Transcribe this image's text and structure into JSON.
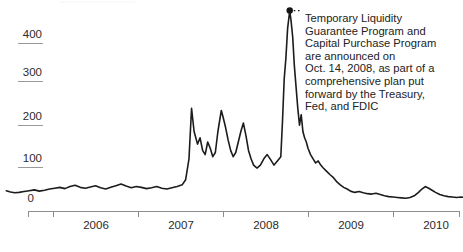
{
  "chart_data": {
    "type": "line",
    "title": "",
    "xlabel": "",
    "ylabel": "",
    "xlim": [
      2005.4,
      2010.85
    ],
    "ylim": [
      0,
      470
    ],
    "grid": false,
    "legend": null,
    "y_ticks": [
      0,
      100,
      200,
      300,
      400
    ],
    "y_tick_labels": [
      "0",
      "100",
      "200",
      "300",
      "400"
    ],
    "x_ticks": [
      2005.4,
      2006.0,
      2007.0,
      2008.0,
      2009.0,
      2010.0,
      2010.85
    ],
    "x_tick_labels": [
      "2006",
      "2007",
      "2008",
      "2009",
      "2010"
    ],
    "series": [
      {
        "name": "TED spread (basis points)",
        "color": "#1c1c1c",
        "points": [
          [
            2005.45,
            34
          ],
          [
            2005.5,
            31
          ],
          [
            2005.55,
            29
          ],
          [
            2005.6,
            30
          ],
          [
            2005.66,
            32
          ],
          [
            2005.72,
            34
          ],
          [
            2005.78,
            36
          ],
          [
            2005.84,
            33
          ],
          [
            2005.9,
            35
          ],
          [
            2005.96,
            38
          ],
          [
            2006.02,
            40
          ],
          [
            2006.08,
            42
          ],
          [
            2006.14,
            39
          ],
          [
            2006.2,
            44
          ],
          [
            2006.26,
            47
          ],
          [
            2006.32,
            42
          ],
          [
            2006.38,
            40
          ],
          [
            2006.44,
            43
          ],
          [
            2006.5,
            46
          ],
          [
            2006.56,
            41
          ],
          [
            2006.62,
            38
          ],
          [
            2006.68,
            42
          ],
          [
            2006.74,
            46
          ],
          [
            2006.8,
            50
          ],
          [
            2006.86,
            45
          ],
          [
            2006.92,
            41
          ],
          [
            2006.98,
            44
          ],
          [
            2007.04,
            42
          ],
          [
            2007.1,
            39
          ],
          [
            2007.16,
            41
          ],
          [
            2007.22,
            44
          ],
          [
            2007.28,
            40
          ],
          [
            2007.34,
            38
          ],
          [
            2007.4,
            41
          ],
          [
            2007.46,
            44
          ],
          [
            2007.52,
            48
          ],
          [
            2007.56,
            60
          ],
          [
            2007.6,
            110
          ],
          [
            2007.63,
            230
          ],
          [
            2007.66,
            175
          ],
          [
            2007.7,
            145
          ],
          [
            2007.73,
            160
          ],
          [
            2007.76,
            130
          ],
          [
            2007.79,
            120
          ],
          [
            2007.82,
            150
          ],
          [
            2007.85,
            135
          ],
          [
            2007.88,
            115
          ],
          [
            2007.91,
            125
          ],
          [
            2007.94,
            175
          ],
          [
            2007.96,
            200
          ],
          [
            2007.98,
            225
          ],
          [
            2008.0,
            210
          ],
          [
            2008.03,
            185
          ],
          [
            2008.06,
            155
          ],
          [
            2008.09,
            130
          ],
          [
            2008.12,
            115
          ],
          [
            2008.15,
            125
          ],
          [
            2008.18,
            150
          ],
          [
            2008.21,
            175
          ],
          [
            2008.24,
            195
          ],
          [
            2008.27,
            165
          ],
          [
            2008.3,
            130
          ],
          [
            2008.33,
            110
          ],
          [
            2008.36,
            95
          ],
          [
            2008.4,
            88
          ],
          [
            2008.44,
            95
          ],
          [
            2008.48,
            110
          ],
          [
            2008.52,
            120
          ],
          [
            2008.56,
            108
          ],
          [
            2008.6,
            95
          ],
          [
            2008.64,
            105
          ],
          [
            2008.68,
            115
          ],
          [
            2008.7,
            200
          ],
          [
            2008.72,
            300
          ],
          [
            2008.74,
            350
          ],
          [
            2008.76,
            420
          ],
          [
            2008.785,
            463
          ],
          [
            2008.8,
            440
          ],
          [
            2008.82,
            400
          ],
          [
            2008.84,
            330
          ],
          [
            2008.86,
            280
          ],
          [
            2008.88,
            230
          ],
          [
            2008.9,
            190
          ],
          [
            2008.92,
            215
          ],
          [
            2008.94,
            175
          ],
          [
            2008.96,
            160
          ],
          [
            2008.98,
            150
          ],
          [
            2009.0,
            135
          ],
          [
            2009.03,
            120
          ],
          [
            2009.06,
            110
          ],
          [
            2009.09,
            100
          ],
          [
            2009.12,
            105
          ],
          [
            2009.15,
            95
          ],
          [
            2009.18,
            88
          ],
          [
            2009.22,
            80
          ],
          [
            2009.26,
            72
          ],
          [
            2009.3,
            65
          ],
          [
            2009.34,
            55
          ],
          [
            2009.38,
            48
          ],
          [
            2009.42,
            42
          ],
          [
            2009.46,
            38
          ],
          [
            2009.5,
            33
          ],
          [
            2009.55,
            30
          ],
          [
            2009.6,
            32
          ],
          [
            2009.65,
            29
          ],
          [
            2009.7,
            27
          ],
          [
            2009.75,
            26
          ],
          [
            2009.8,
            28
          ],
          [
            2009.85,
            25
          ],
          [
            2009.9,
            22
          ],
          [
            2009.95,
            20
          ],
          [
            2010.0,
            19
          ],
          [
            2010.05,
            18
          ],
          [
            2010.1,
            17
          ],
          [
            2010.15,
            16
          ],
          [
            2010.2,
            18
          ],
          [
            2010.25,
            22
          ],
          [
            2010.3,
            30
          ],
          [
            2010.34,
            38
          ],
          [
            2010.38,
            44
          ],
          [
            2010.42,
            40
          ],
          [
            2010.46,
            35
          ],
          [
            2010.5,
            30
          ],
          [
            2010.55,
            25
          ],
          [
            2010.6,
            22
          ],
          [
            2010.65,
            20
          ],
          [
            2010.7,
            19
          ],
          [
            2010.75,
            18
          ],
          [
            2010.8,
            19
          ],
          [
            2010.84,
            18
          ]
        ]
      }
    ],
    "annotations": [
      {
        "name": "tlgp-cpp-announcement",
        "text": "Temporary Liquidity\nGuarantee Program and\nCapital Purchase Program\nare announced on\nOct. 14, 2008, as part of a\ncomprehensive plan put\nforward by the Treasury,\nFed, and FDIC",
        "marker_point": [
          2008.785,
          463
        ],
        "marker_style": "dot-with-dotted-leader"
      }
    ]
  }
}
